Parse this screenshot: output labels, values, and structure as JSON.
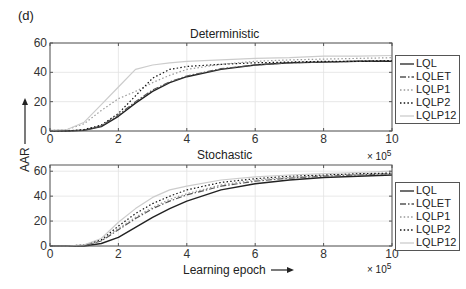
{
  "figure": {
    "panel_label": "(d)",
    "y_axis_label": "AAR",
    "x_axis_label": "Learning epoch",
    "x_multiplier": "× 10",
    "x_multiplier_exp": "5"
  },
  "chart_data": [
    {
      "type": "line",
      "title": "Deterministic",
      "xlabel": "Learning epoch (× 10^5)",
      "ylabel": "AAR",
      "xlim": [
        0,
        10
      ],
      "ylim": [
        0,
        60
      ],
      "xticks": [
        0,
        2,
        4,
        6,
        8,
        10
      ],
      "yticks": [
        0,
        20,
        40,
        60
      ],
      "grid": true,
      "legend_position": "right-outside",
      "x": [
        0,
        0.5,
        1,
        1.5,
        2,
        2.5,
        3,
        3.5,
        4,
        5,
        6,
        7,
        8,
        9,
        10
      ],
      "series": [
        {
          "name": "LQL",
          "style": "solid",
          "color": "#222222",
          "values": [
            0,
            0,
            0.5,
            3,
            10,
            19,
            27,
            33,
            37,
            42,
            45,
            46.5,
            47,
            47.5,
            47.5
          ]
        },
        {
          "name": "LQLET",
          "style": "dashdot",
          "color": "#555555",
          "values": [
            0,
            0,
            0.5,
            3.5,
            11,
            20,
            28,
            33.5,
            37.5,
            42.5,
            45,
            46.5,
            47,
            47.5,
            48
          ]
        },
        {
          "name": "LQLP1",
          "style": "dotted",
          "color": "#999999",
          "values": [
            0.5,
            1,
            5,
            14,
            22,
            27,
            33,
            38,
            42,
            45.5,
            47.5,
            48.5,
            49,
            49.5,
            50
          ]
        },
        {
          "name": "LQLP2",
          "style": "dotted",
          "color": "#111111",
          "values": [
            0,
            0,
            1,
            4,
            12,
            24,
            36,
            42,
            44,
            45.5,
            46.5,
            47,
            47.5,
            47.5,
            48
          ]
        },
        {
          "name": "LQLP12",
          "style": "solid",
          "color": "#cccccc",
          "values": [
            0.5,
            1,
            6,
            18,
            30,
            42,
            45,
            46.5,
            47.5,
            48.5,
            49.5,
            50,
            51,
            51,
            51.5
          ]
        }
      ]
    },
    {
      "type": "line",
      "title": "Stochastic",
      "xlabel": "Learning epoch (× 10^5)",
      "ylabel": "AAR",
      "xlim": [
        0,
        10
      ],
      "ylim": [
        0,
        65
      ],
      "xticks": [
        0,
        2,
        4,
        6,
        8,
        10
      ],
      "yticks": [
        0,
        20,
        40,
        60
      ],
      "grid": true,
      "legend_position": "right-outside",
      "x": [
        0,
        0.5,
        1,
        1.5,
        2,
        2.5,
        3,
        3.5,
        4,
        5,
        6,
        7,
        8,
        9,
        10
      ],
      "series": [
        {
          "name": "LQL",
          "style": "solid",
          "color": "#222222",
          "values": [
            0,
            0,
            0,
            2,
            7,
            15,
            23,
            30,
            36,
            45,
            50,
            53,
            55,
            56,
            57
          ]
        },
        {
          "name": "LQLET",
          "style": "dashdot",
          "color": "#555555",
          "values": [
            0,
            0,
            0.5,
            4,
            13,
            22,
            30,
            36,
            41,
            48,
            52,
            54.5,
            56,
            57,
            58
          ]
        },
        {
          "name": "LQLP1",
          "style": "dotted",
          "color": "#999999",
          "values": [
            0,
            0,
            0.5,
            4.5,
            14,
            23,
            31,
            37.5,
            42,
            49,
            53,
            55,
            56.5,
            57.5,
            58
          ]
        },
        {
          "name": "LQLP2",
          "style": "dotted",
          "color": "#111111",
          "values": [
            0,
            0,
            1,
            5,
            16,
            26,
            34,
            40,
            45,
            51,
            54,
            56,
            57,
            58,
            58.5
          ]
        },
        {
          "name": "LQLP12",
          "style": "solid",
          "color": "#cccccc",
          "values": [
            0,
            0,
            1,
            6,
            19,
            30,
            39,
            45,
            48,
            53,
            55.5,
            57,
            58,
            59,
            60
          ]
        }
      ]
    }
  ]
}
